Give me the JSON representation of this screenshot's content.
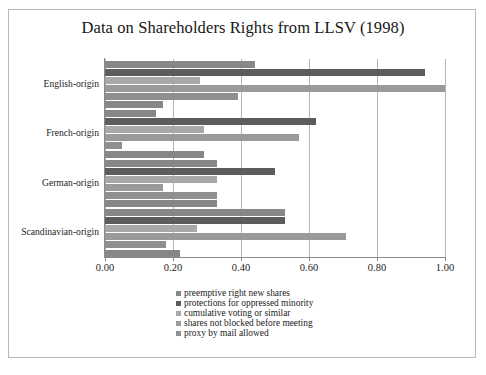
{
  "chart_data": {
    "type": "bar",
    "orientation": "horizontal",
    "title": "Data on Shareholders Rights from LLSV (1998)",
    "xlabel": "",
    "ylabel": "",
    "xlim": [
      0.0,
      1.0
    ],
    "xticks": [
      "0.00",
      "0.20",
      "0.40",
      "0.60",
      "0.80",
      "1.00"
    ],
    "xtick_values": [
      0.0,
      0.2,
      0.4,
      0.6,
      0.8,
      1.0
    ],
    "grid": "vertical",
    "legend_position": "bottom-center",
    "categories": [
      "English-origin",
      "French-origin",
      "German-origin",
      "Scandinavian-origin"
    ],
    "series": [
      {
        "name": "preemptive right new shares",
        "color": "#878787",
        "values": [
          0.44,
          0.15,
          0.33,
          0.53
        ]
      },
      {
        "name": "protections for oppressed minority",
        "color": "#5c5c5c",
        "values": [
          0.94,
          0.62,
          0.5,
          0.53
        ]
      },
      {
        "name": "cumulative voting or similar",
        "color": "#a8a8a8",
        "values": [
          0.28,
          0.29,
          0.33,
          0.27
        ]
      },
      {
        "name": "shares not blocked before meeting",
        "color": "#9a9a9a",
        "values": [
          1.0,
          0.57,
          0.17,
          0.71
        ]
      },
      {
        "name": "proxy by mail allowed",
        "color": "#8f8f8f",
        "values": [
          0.39,
          0.05,
          0.33,
          0.18
        ]
      }
    ],
    "extra_bars": {
      "note": "each category group additionally shows a trailing segment",
      "values": [
        0.17,
        0.29,
        0.33,
        0.22
      ]
    }
  },
  "legend": {
    "items": [
      "preemptive right new shares",
      "protections for oppressed minority",
      "cumulative voting or similar",
      "shares not blocked before meeting",
      "proxy by mail allowed"
    ]
  },
  "colors": {
    "frame_border": "#b9b9b9",
    "gridline": "#b5b5b5",
    "axis": "#8a8a8a",
    "text": "#1c1c1c",
    "background": "#ffffff"
  }
}
